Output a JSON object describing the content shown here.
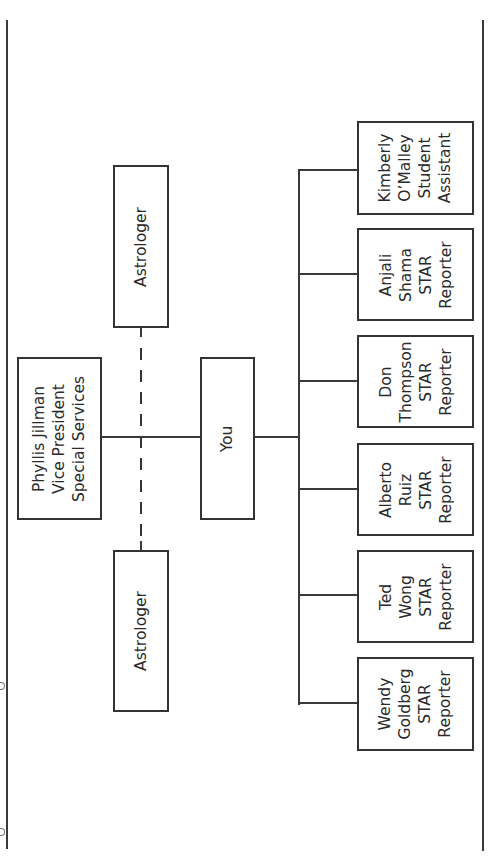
{
  "diagram": {
    "type": "org-chart",
    "orientation": "rotated-90-ccw",
    "top_level": {
      "name": "Phyllis Jillman",
      "title_line1": "Vice President",
      "title_line2": "Special Services"
    },
    "advisors": [
      {
        "label": "Astrologer",
        "relation": "dotted-line"
      },
      {
        "label": "Astrologer",
        "relation": "dotted-line"
      }
    ],
    "middle": {
      "label": "You"
    },
    "reports": [
      {
        "line1": "Kimberly",
        "line2": "O’Malley",
        "line3": "Student",
        "line4": "Assistant"
      },
      {
        "line1": "Anjali",
        "line2": "Shama",
        "line3": "STAR",
        "line4": "Reporter"
      },
      {
        "line1": "Don",
        "line2": "Thompson",
        "line3": "STAR",
        "line4": "Reporter"
      },
      {
        "line1": "Alberto",
        "line2": "Ruiz",
        "line3": "STAR",
        "line4": "Reporter"
      },
      {
        "line1": "Ted",
        "line2": "Wong",
        "line3": "STAR",
        "line4": "Reporter"
      },
      {
        "line1": "Wendy",
        "line2": "Goldberg",
        "line3": "STAR",
        "line4": "Reporter"
      }
    ],
    "colors": {
      "line": "#333333",
      "background": "#ffffff",
      "text": "#2a2a2a"
    }
  }
}
